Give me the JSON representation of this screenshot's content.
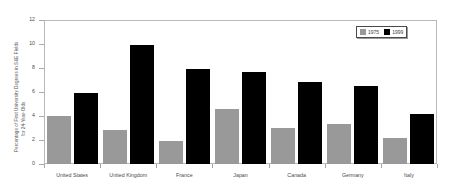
{
  "chart_data": {
    "type": "bar",
    "title": "",
    "xlabel": "",
    "ylabel": "Percentage of First University Degrees in S&E Fields for 24-Year-Olds",
    "ylabel_lines": [
      "Percentage of First University Degrees in S&E Fields",
      "for 24-Year-Olds"
    ],
    "categories": [
      "United States",
      "United Kingdom",
      "France",
      "Japan",
      "Canada",
      "Germany",
      "Italy"
    ],
    "series": [
      {
        "name": "1975",
        "color": "#999999",
        "values": [
          4.0,
          2.8,
          1.9,
          4.6,
          3.0,
          3.3,
          2.2
        ]
      },
      {
        "name": "1999",
        "color": "#000000",
        "values": [
          5.9,
          9.9,
          7.9,
          7.7,
          6.8,
          6.5,
          4.2
        ]
      }
    ],
    "ylim": [
      0,
      12
    ],
    "yticks": [
      0,
      2,
      4,
      6,
      8,
      10,
      12
    ],
    "ytick_labels": [
      "0",
      "2",
      "4",
      "6",
      "8",
      "10",
      "12"
    ],
    "grid": false,
    "legend_position": "top-right",
    "legend_entries": [
      "1975",
      "1999"
    ]
  },
  "colors": {
    "series_1975": "#999999",
    "series_1999": "#000000",
    "axis": "#b9b9b9",
    "text": "#4a4a4a",
    "background": "#ffffff"
  }
}
